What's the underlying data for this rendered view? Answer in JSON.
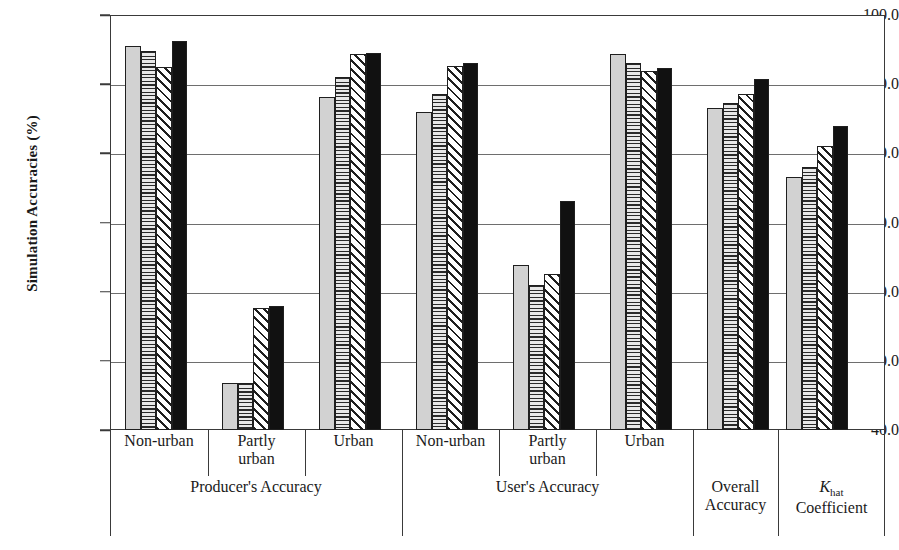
{
  "chart_data": {
    "type": "bar",
    "title": "",
    "xlabel": "",
    "ylabel": "Simulation Accuracies (%)",
    "ylim": [
      40.0,
      100.0
    ],
    "ytick_labels": [
      "100.0",
      "90.0",
      "80.0",
      "70.0",
      "60.0",
      "50.0",
      "40.0"
    ],
    "ytick_values": [
      100.0,
      90.0,
      80.0,
      70.0,
      60.0,
      50.0,
      40.0
    ],
    "grid": true,
    "legend_position": "none",
    "categories": [
      "Non-urban",
      "Partly\nurban",
      "Urban",
      "Non-urban",
      "Partly\nurban",
      "Urban",
      "Overall\nAccuracy",
      "Khat\nCoefficient"
    ],
    "group_labels": [
      "Producer's  Accuracy",
      "User's Accuracy",
      "Overall Accuracy",
      "Khat Coefficient"
    ],
    "series": [
      {
        "name": "series-1",
        "pattern": "solid-light-gray",
        "values": [
          95.5,
          46.8,
          88.2,
          86.0,
          63.9,
          94.4,
          86.6,
          76.6
        ]
      },
      {
        "name": "series-2",
        "pattern": "horizontal-lines",
        "values": [
          94.8,
          46.8,
          91.0,
          88.6,
          61.0,
          93.1,
          87.3,
          78.0
        ]
      },
      {
        "name": "series-3",
        "pattern": "diagonal-hatch",
        "values": [
          92.5,
          57.6,
          94.3,
          92.7,
          62.5,
          91.9,
          88.6,
          81.0
        ]
      },
      {
        "name": "series-4",
        "pattern": "solid-black",
        "values": [
          96.2,
          57.9,
          94.5,
          93.1,
          73.1,
          92.4,
          90.7,
          84.0
        ]
      }
    ]
  },
  "axis": {
    "y_title": "Simulation Accuracies (%)",
    "ticks": [
      "100.0",
      "90.0",
      "80.0",
      "70.0",
      "60.0",
      "50.0",
      "40.0"
    ]
  },
  "categories": [
    {
      "line1": "Non-urban",
      "line2": ""
    },
    {
      "line1": "Partly",
      "line2": "urban"
    },
    {
      "line1": "Urban",
      "line2": ""
    },
    {
      "line1": "Non-urban",
      "line2": ""
    },
    {
      "line1": "Partly",
      "line2": "urban"
    },
    {
      "line1": "Urban",
      "line2": ""
    },
    {
      "line1": "",
      "line2": ""
    },
    {
      "line1": "",
      "line2": ""
    }
  ],
  "groups": [
    {
      "line1": "Producer's  Accuracy",
      "line2": ""
    },
    {
      "line1": "User's Accuracy",
      "line2": ""
    },
    {
      "line1": "Overall",
      "line2": "Accuracy"
    },
    {
      "line1": "Khat",
      "line2": "Coefficient"
    }
  ],
  "khat": {
    "symbol": "K",
    "sub": "hat",
    "word": "Coefficient"
  },
  "colors": {
    "series_1": "#d2d2d2",
    "series_2": "#e8e8e8",
    "series_4": "#111111",
    "axis": "#3a3a3a",
    "grid": "#6e6e6e",
    "background": "#ffffff"
  }
}
